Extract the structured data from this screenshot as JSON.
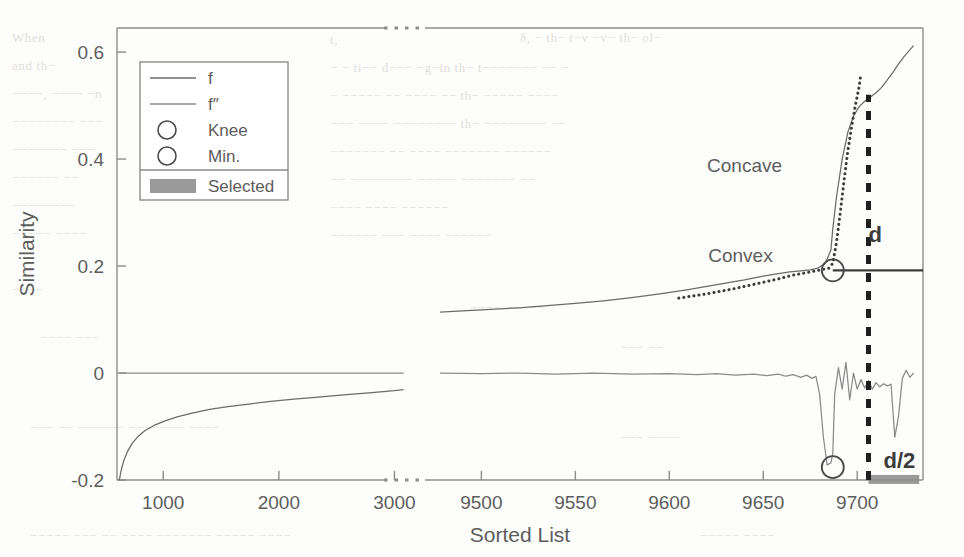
{
  "figure": {
    "ylabel": "Similarity",
    "xlabel": "Sorted List",
    "grid": false,
    "axis_break": true
  },
  "legend": {
    "position": "upper-left-inset",
    "entries": [
      {
        "label": "f",
        "marker": "line",
        "color": "#6b6b6b"
      },
      {
        "label": "f″",
        "marker": "line",
        "color": "#8a8a8a"
      },
      {
        "label": "Knee",
        "marker": "circle",
        "color": "#4a4a4a"
      },
      {
        "label": "Min.",
        "marker": "circle",
        "color": "#4a4a4a"
      },
      {
        "label": "Selected",
        "marker": "patch",
        "color": "#9a9a9a"
      }
    ]
  },
  "annotations": [
    {
      "name": "concave-label",
      "text": "Concave",
      "x": 9660,
      "y": 0.375
    },
    {
      "name": "convex-label",
      "text": "Convex",
      "x": 9655,
      "y": 0.207
    },
    {
      "name": "d-label",
      "text": "d",
      "x": 9706,
      "y": 0.245
    },
    {
      "name": "d-half-label",
      "text": "d/2",
      "x": 9714,
      "y": -0.178
    }
  ],
  "colors": {
    "f": "#6b6b6b",
    "f2": "#8a8a8a",
    "hull": "#3c3c3c",
    "marker": "#4a4a4a",
    "selected_band": "#9a9a9a",
    "dashed_d": "#1f1f1f",
    "frame": "#8c8c8c",
    "text": "#5d5d5d"
  },
  "chart_data": {
    "type": "line",
    "title": "",
    "xlabel": "Sorted List",
    "ylabel": "Similarity",
    "grid": false,
    "broken_axis": {
      "left_range": [
        600,
        3100
      ],
      "right_range": [
        9470,
        9735
      ],
      "left_ticks": [
        1000,
        2000,
        3000
      ],
      "right_ticks": [
        9500,
        9550,
        9600,
        9650,
        9700
      ]
    },
    "ylim": [
      -0.2,
      0.645
    ],
    "yticks": [
      -0.2,
      0,
      0.2,
      0.4,
      0.6
    ],
    "ytick_labels": [
      "-0.2",
      "0",
      "0.2",
      "0.4",
      "0.6"
    ],
    "xtick_labels": [
      "1000",
      "2000",
      "3000",
      "9500",
      "9550",
      "9600",
      "9650",
      "9700"
    ],
    "series": [
      {
        "name": "f",
        "style": "solid",
        "segment": "left",
        "x": [
          620,
          640,
          660,
          690,
          730,
          780,
          840,
          920,
          1010,
          1120,
          1250,
          1400,
          1560,
          1740,
          1930,
          2130,
          2340,
          2560,
          2780,
          3000,
          3080
        ],
        "y": [
          -0.2,
          -0.178,
          -0.163,
          -0.147,
          -0.132,
          -0.119,
          -0.108,
          -0.098,
          -0.09,
          -0.082,
          -0.075,
          -0.068,
          -0.063,
          -0.058,
          -0.053,
          -0.049,
          -0.045,
          -0.041,
          -0.037,
          -0.033,
          -0.031
        ]
      },
      {
        "name": "f",
        "style": "solid",
        "segment": "right",
        "x": [
          9478,
          9490,
          9505,
          9520,
          9535,
          9550,
          9565,
          9580,
          9595,
          9610,
          9620,
          9630,
          9640,
          9650,
          9658,
          9664,
          9670,
          9675,
          9679,
          9683,
          9686,
          9687,
          9689,
          9692,
          9695,
          9698,
          9701,
          9704,
          9707,
          9710,
          9713,
          9716,
          9719,
          9722,
          9725,
          9728,
          9730
        ],
        "y": [
          0.114,
          0.116,
          0.119,
          0.122,
          0.126,
          0.13,
          0.135,
          0.141,
          0.148,
          0.156,
          0.162,
          0.168,
          0.174,
          0.181,
          0.186,
          0.189,
          0.191,
          0.193,
          0.196,
          0.205,
          0.23,
          0.27,
          0.33,
          0.4,
          0.45,
          0.48,
          0.498,
          0.508,
          0.516,
          0.524,
          0.534,
          0.548,
          0.562,
          0.578,
          0.592,
          0.604,
          0.612
        ]
      },
      {
        "name": "f″",
        "style": "solid",
        "segment": "left",
        "x": [
          620,
          900,
          1400,
          2000,
          2600,
          3080
        ],
        "y": [
          0.0,
          0.0,
          0.0,
          0.0,
          0.0,
          0.0
        ]
      },
      {
        "name": "f″",
        "style": "solid",
        "segment": "right",
        "x": [
          9478,
          9500,
          9520,
          9540,
          9560,
          9580,
          9600,
          9615,
          9625,
          9635,
          9645,
          9652,
          9658,
          9662,
          9666,
          9670,
          9673,
          9676,
          9678,
          9680,
          9682,
          9684,
          9686,
          9687,
          9688,
          9690,
          9692,
          9694,
          9696,
          9698,
          9700,
          9702,
          9704,
          9706,
          9708,
          9710,
          9712,
          9714,
          9716,
          9718,
          9720,
          9722,
          9724,
          9726,
          9728,
          9730
        ],
        "y": [
          0.0,
          -0.001,
          0.0,
          -0.002,
          0.0,
          -0.002,
          -0.001,
          -0.003,
          -0.001,
          -0.004,
          -0.002,
          -0.005,
          -0.002,
          -0.006,
          -0.003,
          -0.008,
          -0.004,
          -0.01,
          -0.006,
          -0.04,
          -0.12,
          -0.172,
          -0.168,
          -0.15,
          -0.04,
          0.01,
          -0.03,
          0.02,
          -0.05,
          0.0,
          -0.03,
          -0.012,
          -0.028,
          -0.014,
          -0.03,
          -0.018,
          -0.026,
          -0.02,
          -0.024,
          -0.021,
          -0.12,
          -0.08,
          -0.01,
          0.005,
          -0.008,
          0.0
        ]
      },
      {
        "name": "hull",
        "style": "dotted",
        "segment": "right",
        "x": [
          9605,
          9620,
          9635,
          9648,
          9658,
          9666,
          9672,
          9678,
          9682,
          9685,
          9687,
          9689,
          9691,
          9693,
          9695,
          9697,
          9699,
          9701,
          9702
        ],
        "y": [
          0.14,
          0.148,
          0.158,
          0.168,
          0.176,
          0.183,
          0.187,
          0.191,
          0.194,
          0.196,
          0.205,
          0.245,
          0.3,
          0.36,
          0.415,
          0.46,
          0.5,
          0.535,
          0.56
        ]
      }
    ],
    "markers": [
      {
        "name": "Knee",
        "x": 9687,
        "y": 0.192,
        "shape": "circle"
      },
      {
        "name": "Min.",
        "x": 9687,
        "y": -0.176,
        "shape": "circle"
      }
    ],
    "reference_lines": [
      {
        "name": "knee-horizontal",
        "type": "horizontal",
        "y": 0.192,
        "from_x": 9687,
        "to_x": 9735,
        "style": "solid"
      },
      {
        "name": "d-vertical",
        "type": "vertical",
        "x": 9706,
        "from_y": -0.2,
        "to_y": 0.52,
        "style": "dashed"
      }
    ],
    "shaded_regions": [
      {
        "name": "selected-band",
        "x0": 9706,
        "x1": 9733,
        "y0": -0.2,
        "y1": -0.1905
      }
    ]
  }
}
